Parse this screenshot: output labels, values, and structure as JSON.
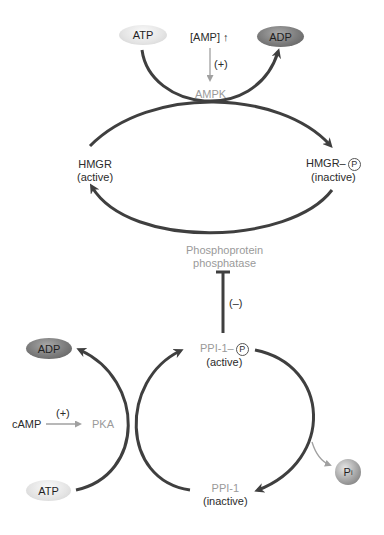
{
  "diagram": {
    "top_cycle": {
      "substrate_left": "ATP",
      "product_right": "ADP",
      "activator": "[AMP] ↑",
      "activator_effect": "(+)",
      "kinase": "AMPK",
      "enzyme_active_name": "HMGR",
      "enzyme_active_state": "(active)",
      "enzyme_inactive_name": "HMGR–",
      "enzyme_inactive_phospho": "P",
      "enzyme_inactive_state": "(inactive)",
      "phosphatase_line1": "Phosphoprotein",
      "phosphatase_line2": "phosphatase"
    },
    "inhibition": {
      "effect": "(–)"
    },
    "bottom_cycle": {
      "product_left": "ADP",
      "substrate_left": "ATP",
      "activator": "cAMP",
      "activator_effect": "(+)",
      "kinase": "PKA",
      "inhibitor_active_name": "PPI-1–",
      "inhibitor_active_phospho": "P",
      "inhibitor_active_state": "(active)",
      "inhibitor_inactive_name": "PPI-1",
      "inhibitor_inactive_state": "(inactive)",
      "phosphate_released": "P",
      "phosphate_subscript": "i"
    },
    "colors": {
      "arrow": "#3f3f3f",
      "enzyme_label_gray": "#9a9a9a",
      "thin_arrow_gray": "#a0a0a0",
      "adp_oval": "#7b7b7b",
      "atp_oval": "#e4e4e4"
    }
  }
}
